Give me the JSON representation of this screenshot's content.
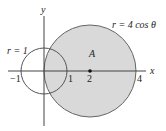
{
  "diagram": {
    "axes": {
      "x_label": "x",
      "y_label": "y"
    },
    "ticks": {
      "neg_one": "−1",
      "one": "1",
      "two": "2",
      "four": "4"
    },
    "curves": {
      "small_circle": {
        "label": "r = 1",
        "radius": 1
      },
      "large_circle": {
        "label": "r = 4 cos θ",
        "center_x": 2,
        "radius": 2
      }
    },
    "region_label": "A",
    "colors": {
      "fill": "#d9d9d9",
      "stroke": "#555555",
      "axis": "#444444"
    }
  }
}
